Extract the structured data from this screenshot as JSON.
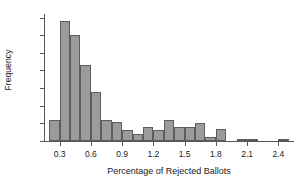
{
  "chart_data": {
    "type": "bar",
    "title": "",
    "subtitle": "",
    "xlabel": "Percentage of Rejected Ballots",
    "ylabel": "Frequency",
    "grid": false,
    "legend": null,
    "xlim": [
      0.15,
      2.55
    ],
    "ylim": [
      0,
      72
    ],
    "bin_width": 0.1,
    "xticks": [
      0.3,
      0.6,
      0.9,
      1.2,
      1.5,
      1.8,
      2.1,
      2.4
    ],
    "xtick_labels": [
      "0.3",
      "0.6",
      "0.9",
      "1.2",
      "1.5",
      "1.8",
      "2.1",
      "2.4"
    ],
    "yticks": [
      0,
      10,
      20,
      30,
      40,
      50,
      60,
      70
    ],
    "ytick_labels": [
      "0",
      "10",
      "20",
      "30",
      "40",
      "50",
      "60",
      "70"
    ],
    "bin_starts": [
      0.2,
      0.3,
      0.4,
      0.5,
      0.6,
      0.7,
      0.8,
      0.9,
      1.0,
      1.1,
      1.2,
      1.3,
      1.4,
      1.5,
      1.6,
      1.7,
      1.8,
      1.9,
      2.0,
      2.1,
      2.2,
      2.3,
      2.4
    ],
    "categories": [
      "0.2-0.3",
      "0.3-0.4",
      "0.4-0.5",
      "0.5-0.6",
      "0.6-0.7",
      "0.7-0.8",
      "0.8-0.9",
      "0.9-1.0",
      "1.0-1.1",
      "1.1-1.2",
      "1.2-1.3",
      "1.3-1.4",
      "1.4-1.5",
      "1.5-1.6",
      "1.6-1.7",
      "1.7-1.8",
      "1.8-1.9",
      "1.9-2.0",
      "2.0-2.1",
      "2.1-2.2",
      "2.2-2.3",
      "2.3-2.4",
      "2.4-2.5"
    ],
    "values": [
      12,
      68,
      60,
      43,
      28,
      12,
      11,
      6,
      4,
      8,
      6,
      12,
      8,
      8,
      10,
      2,
      7,
      0,
      1,
      1,
      0,
      0,
      1
    ],
    "bar_color": "#9b9b9b",
    "bar_edge_color": "#5d5d5d",
    "axis_color": "#55595c",
    "background": "#ffffff"
  }
}
